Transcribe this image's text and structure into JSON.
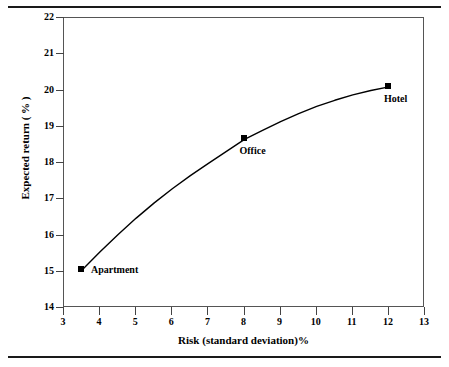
{
  "chart_data": {
    "type": "line",
    "title": "",
    "xlabel": "Risk (standard deviation)%",
    "ylabel": "Expected return ( % )",
    "xlim": [
      3,
      13
    ],
    "ylim": [
      14,
      22
    ],
    "grid": false,
    "legend": "none",
    "x_ticks": [
      "3",
      "4",
      "5",
      "6",
      "7",
      "8",
      "9",
      "10",
      "11",
      "12",
      "13"
    ],
    "y_ticks": [
      "14",
      "15",
      "16",
      "17",
      "18",
      "19",
      "20",
      "21",
      "22"
    ],
    "series": [
      {
        "name": "risk-return curve",
        "x": [
          3.5,
          4.0,
          4.5,
          5.0,
          5.5,
          6.0,
          6.5,
          7.0,
          7.5,
          8.0,
          8.5,
          9.0,
          9.5,
          10.0,
          10.5,
          11.0,
          11.5,
          12.0
        ],
        "y": [
          15.05,
          15.55,
          16.03,
          16.48,
          16.9,
          17.29,
          17.65,
          17.99,
          18.32,
          18.65,
          18.9,
          19.14,
          19.36,
          19.56,
          19.73,
          19.88,
          20.0,
          20.1
        ]
      }
    ],
    "points": [
      {
        "label": "Apartment",
        "x": 3.5,
        "y": 15.05,
        "label_dx": 10,
        "label_dy": -5
      },
      {
        "label": "Office",
        "x": 8.0,
        "y": 18.65,
        "label_dx": -4,
        "label_dy": 7
      },
      {
        "label": "Hotel",
        "x": 12.0,
        "y": 20.1,
        "label_dx": -4,
        "label_dy": 7
      }
    ],
    "colors": {
      "line": "#000000",
      "marker": "#000000",
      "axis": "#555555",
      "rule": "#1a1a1a",
      "background": "#ffffff"
    }
  }
}
